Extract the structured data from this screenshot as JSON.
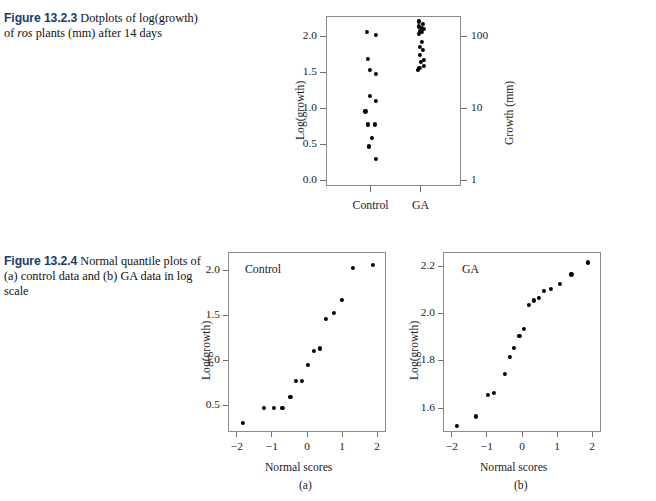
{
  "page": {
    "width": 656,
    "height": 501,
    "background": "#ffffff",
    "figure_number_color": "#1b3a6b",
    "axis_color": "#8b8b8b",
    "dot_color": "#000000"
  },
  "figure_1": {
    "number": "Figure 13.2.3",
    "caption_part1": "  Dotplots of log(growth) of ",
    "caption_italic": "ros",
    "caption_part2": " plants (mm) after 14 days",
    "caption_plain": "Figure 13.2.3  Dotplots of log(growth) of ros plants (mm) after 14 days",
    "chart_data": {
      "type": "scatter",
      "title": "",
      "xlabel": "",
      "ylabel": "Log(growth)",
      "y2label": "Growth (mm)",
      "ylim": [
        -0.08,
        2.28
      ],
      "yticks": [
        0.0,
        0.5,
        1.0,
        1.5,
        2.0
      ],
      "yticklabels": [
        "0.0",
        "0.5",
        "1.0",
        "1.5",
        "2.0"
      ],
      "y2ticks": [
        0.0,
        1.0,
        2.0
      ],
      "y2ticklabels": [
        "1",
        "10",
        "100"
      ],
      "grid": false,
      "categories": [
        "Control",
        "GA"
      ],
      "series": [
        {
          "name": "Control",
          "x_center": 0.33,
          "values": [
            2.07,
            2.03,
            1.7,
            1.55,
            1.49,
            1.18,
            1.12,
            0.97,
            0.79,
            0.79,
            0.6,
            0.49,
            0.48,
            0.31
          ],
          "jitter": [
            -0.035,
            0.035,
            -0.025,
            -0.012,
            0.035,
            -0.01,
            0.03,
            -0.045,
            -0.03,
            0.022,
            0.0,
            -0.022,
            -0.022,
            0.03
          ]
        },
        {
          "name": "GA",
          "x_center": 0.7,
          "values": [
            2.22,
            2.18,
            2.15,
            2.13,
            2.11,
            2.09,
            2.07,
            2.04,
            1.93,
            1.86,
            1.82,
            1.75,
            1.68,
            1.66,
            1.6,
            1.57,
            1.55
          ],
          "jitter": [
            -0.018,
            0.01,
            -0.022,
            0.0,
            0.018,
            -0.012,
            0.006,
            -0.02,
            0.002,
            -0.01,
            0.012,
            -0.014,
            0.016,
            -0.004,
            0.016,
            -0.016,
            -0.028
          ]
        }
      ]
    }
  },
  "figure_2": {
    "number": "Figure 13.2.4",
    "caption_plain": "Figure 13.2.4  Normal quantile plots of (a) control data and (b) GA data in log scale",
    "caption_rest": "  Normal quantile plots of (a) control data and (b) GA data in log scale",
    "panel_a": {
      "tag": "(a)",
      "inlabel": "Control",
      "chart_data": {
        "type": "scatter",
        "title": "Control",
        "xlabel": "Normal scores",
        "ylabel": "Log(growth)",
        "xlim": [
          -2.25,
          2.25
        ],
        "ylim": [
          0.2,
          2.2
        ],
        "xticks": [
          -2,
          -1,
          0,
          1,
          2
        ],
        "xticklabels": [
          "−2",
          "−1",
          "0",
          "1",
          "2"
        ],
        "yticks": [
          0.5,
          1.0,
          1.5,
          2.0
        ],
        "yticklabels": [
          "0.5",
          "1.0",
          "1.5",
          "2.0"
        ],
        "grid": false,
        "x": [
          -1.85,
          -1.25,
          -0.97,
          -0.73,
          -0.5,
          -0.35,
          -0.17,
          0.0,
          0.17,
          0.33,
          0.52,
          0.73,
          0.97,
          1.27,
          1.85
        ],
        "y": [
          0.31,
          0.48,
          0.48,
          0.48,
          0.6,
          0.78,
          0.78,
          0.96,
          1.11,
          1.14,
          1.47,
          1.53,
          1.68,
          2.03,
          2.07
        ]
      }
    },
    "panel_b": {
      "tag": "(b)",
      "inlabel": "GA",
      "chart_data": {
        "type": "scatter",
        "title": "GA",
        "xlabel": "Normal scores",
        "ylabel": "Log(growth)",
        "xlim": [
          -2.25,
          2.25
        ],
        "ylim": [
          1.5,
          2.26
        ],
        "xticks": [
          -2,
          -1,
          0,
          1,
          2
        ],
        "xticklabels": [
          "−2",
          "−1",
          "0",
          "1",
          "2"
        ],
        "yticks": [
          1.6,
          1.8,
          2.0,
          2.2
        ],
        "yticklabels": [
          "1.6",
          "1.8",
          "2.0",
          "2.2"
        ],
        "yminorticks": [
          1.7,
          1.9,
          2.1
        ],
        "grid": false,
        "x": [
          -1.88,
          -1.33,
          -1.0,
          -0.83,
          -0.52,
          -0.38,
          -0.25,
          -0.1,
          0.03,
          0.17,
          0.32,
          0.45,
          0.6,
          0.8,
          1.05,
          1.38,
          1.85
        ],
        "y": [
          1.53,
          1.57,
          1.66,
          1.67,
          1.75,
          1.82,
          1.86,
          1.91,
          1.94,
          2.04,
          2.06,
          2.07,
          2.1,
          2.11,
          2.13,
          2.17,
          2.22
        ]
      }
    }
  }
}
